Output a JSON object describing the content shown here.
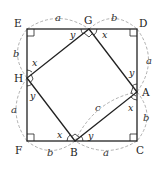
{
  "figure": {
    "vertices": {
      "E": "E",
      "G": "G",
      "D": "D",
      "A": "A",
      "C": "C",
      "B": "B",
      "F": "F",
      "H": "H"
    },
    "side_labels": {
      "EG": "a",
      "GD": "b",
      "DA": "a",
      "AC": "b",
      "CB": "a",
      "BF": "b",
      "FH": "a",
      "HE": "b",
      "AB": "c"
    },
    "angle_labels": {
      "G_left": "y",
      "G_right": "x",
      "A_top": "y",
      "A_bottom": "x",
      "B_left": "x",
      "B_right": "y",
      "H_top": "x",
      "H_bottom": "y"
    },
    "colors": {
      "line": "#222222",
      "dashed_arc": "#9a9a9a",
      "text": "#222222"
    }
  }
}
